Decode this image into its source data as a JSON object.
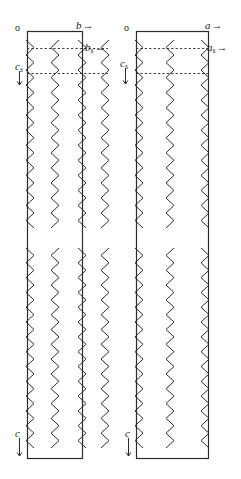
{
  "figure": {
    "width": 241,
    "height": 479,
    "background": "#ffffff",
    "line_color": "#2b2b2b",
    "dash_color": "#3a3a3a"
  },
  "panels": [
    {
      "id": "left-panel",
      "name": "projection-along-a-axis",
      "box": {
        "x": 27,
        "y": 31,
        "width": 55,
        "height": 427
      },
      "labels": {
        "origin": {
          "text": "o",
          "x": 16,
          "y": 24
        },
        "horizontal_axis": {
          "text": "b",
          "sub": "",
          "arrow": "→",
          "x": 77,
          "y": 20
        },
        "horizontal_axis_sub": {
          "text": "b",
          "sub": "s",
          "arrow": "→",
          "x": 85,
          "y": 42
        },
        "vertical_axis_sub": {
          "text": "c",
          "sub": "s",
          "arrow": "↓",
          "x": 16,
          "y": 61
        },
        "vertical_axis": {
          "text": "c",
          "sub": "",
          "arrow": "↓",
          "x": 16,
          "y": 428
        }
      },
      "dashed_lines": [
        {
          "y": 48,
          "x1": 27,
          "x2": 108
        },
        {
          "y": 73,
          "x1": 27,
          "x2": 108
        }
      ],
      "chains": [
        {
          "x": 30,
          "phase": 0
        },
        {
          "x": 55,
          "phase": 0.5
        },
        {
          "x": 82,
          "phase": 0
        },
        {
          "x": 105,
          "phase": 0.5
        }
      ]
    },
    {
      "id": "right-panel",
      "name": "projection-along-b-axis",
      "box": {
        "x": 136,
        "y": 31,
        "width": 72,
        "height": 427
      },
      "labels": {
        "origin": {
          "text": "o",
          "x": 125,
          "y": 24
        },
        "horizontal_axis": {
          "text": "a",
          "sub": "",
          "arrow": "→",
          "x": 205,
          "y": 20
        },
        "horizontal_axis_sub": {
          "text": "a",
          "sub": "s",
          "arrow": "→",
          "x": 207,
          "y": 42
        },
        "vertical_axis_sub": {
          "text": "c",
          "sub": "s",
          "arrow": "↓",
          "x": 121,
          "y": 58
        },
        "vertical_axis": {
          "text": "c",
          "sub": "",
          "arrow": "↓",
          "x": 126,
          "y": 428
        }
      },
      "dashed_lines": [
        {
          "y": 48,
          "x1": 136,
          "x2": 210
        },
        {
          "y": 73,
          "x1": 136,
          "x2": 210
        }
      ],
      "chains": [
        {
          "x": 139,
          "phase": 0
        },
        {
          "x": 170,
          "phase": 0.5
        },
        {
          "x": 205,
          "phase": 0
        }
      ]
    }
  ],
  "chain_geometry": {
    "segment_top_start": 40,
    "segment_top_end": 228,
    "segment_bottom_start": 248,
    "segment_bottom_end": 448,
    "zigzag_amplitude": 4,
    "zigzag_period": 15
  }
}
